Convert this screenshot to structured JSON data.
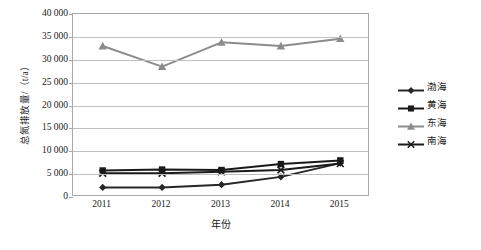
{
  "chart_data": {
    "type": "line",
    "title": "",
    "xlabel": "年份",
    "ylabel": "总氮排放量/（t/a）",
    "categories": [
      "2011",
      "2012",
      "2013",
      "2014",
      "2015"
    ],
    "x": [
      2011,
      2012,
      2013,
      2014,
      2015
    ],
    "ylim": [
      0,
      40000
    ],
    "ytick_step": 5000,
    "ytick_labels": [
      "40 000",
      "35 000",
      "30 000",
      "25 000",
      "20 000",
      "15 000",
      "10 000",
      "5 000",
      "0"
    ],
    "ytick_values": [
      40000,
      35000,
      30000,
      25000,
      20000,
      15000,
      10000,
      5000,
      0
    ],
    "grid": true,
    "grid_axis": "y",
    "legend_position": "right",
    "series": [
      {
        "name": "渤海",
        "marker": "diamond",
        "color": "#262626",
        "values": [
          2100,
          2100,
          2700,
          4400,
          7400
        ]
      },
      {
        "name": "黄海",
        "marker": "square",
        "color": "#1a1a1a",
        "values": [
          5800,
          6000,
          5900,
          7200,
          8000
        ]
      },
      {
        "name": "东海",
        "marker": "triangle",
        "color": "#8c8c8c",
        "values": [
          33000,
          28500,
          33800,
          33000,
          34600
        ]
      },
      {
        "name": "南海",
        "marker": "cross",
        "color": "#1a1a1a",
        "values": [
          5200,
          5200,
          5500,
          5900,
          7300
        ]
      }
    ]
  },
  "legend": {
    "items": [
      {
        "label": "渤海"
      },
      {
        "label": "黄海"
      },
      {
        "label": "东海"
      },
      {
        "label": "南海"
      }
    ]
  },
  "axes": {
    "x_title": "年份",
    "y_title": "总氮排放量/（t/a）"
  },
  "colors": {
    "plot_border": "#a9a9a9",
    "gridline": "#bfbfbf",
    "background": "#ffffff",
    "series_dark": "#1a1a1a",
    "series_gray": "#8c8c8c"
  }
}
